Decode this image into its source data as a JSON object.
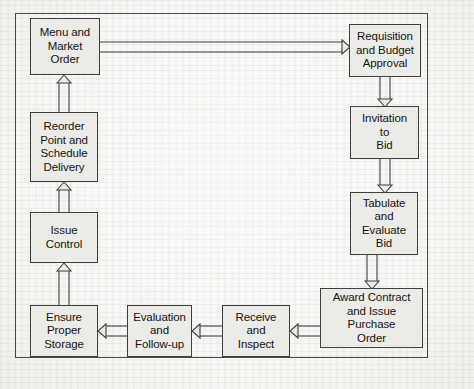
{
  "diagram": {
    "type": "flowchart",
    "orientation": "clockwise-loop",
    "frame": {
      "border_color": "#4a4a48"
    },
    "node_style": {
      "fill": "#ebebe8",
      "border": "#3f3f3d",
      "text": "#14140f"
    },
    "nodes": [
      {
        "id": "menu-and-market-order",
        "label": "Menu and\nMarket\nOrder",
        "x": 30,
        "y": 18,
        "w": 70,
        "h": 57
      },
      {
        "id": "requisition-and-budget-approval",
        "label": "Requisition\nand Budget\nApproval",
        "x": 349,
        "y": 24,
        "w": 72,
        "h": 53
      },
      {
        "id": "invitation-to-bid",
        "label": "Invitation\nto\nBid",
        "x": 350,
        "y": 106,
        "w": 69,
        "h": 53
      },
      {
        "id": "tabulate-and-evaluate-bid",
        "label": "Tabulate\nand\nEvaluate\nBid",
        "x": 350,
        "y": 192,
        "w": 68,
        "h": 63
      },
      {
        "id": "award-contract-and-issue-purchase-order",
        "label": "Award Contract\nand Issue\nPurchase\nOrder",
        "x": 320,
        "y": 288,
        "w": 103,
        "h": 60
      },
      {
        "id": "receive-and-inspect",
        "label": "Receive\nand\nInspect",
        "x": 222,
        "y": 305,
        "w": 68,
        "h": 52
      },
      {
        "id": "evaluation-and-follow-up",
        "label": "Evaluation\nand\nFollow-up",
        "x": 127,
        "y": 305,
        "w": 65,
        "h": 52
      },
      {
        "id": "ensure-proper-storage",
        "label": "Ensure\nProper\nStorage",
        "x": 30,
        "y": 305,
        "w": 68,
        "h": 52
      },
      {
        "id": "issue-control",
        "label": "Issue\nControl",
        "x": 30,
        "y": 212,
        "w": 68,
        "h": 51
      },
      {
        "id": "reorder-point-and-schedule-delivery",
        "label": "Reorder\nPoint and\nSchedule\nDelivery",
        "x": 30,
        "y": 112,
        "w": 68,
        "h": 70
      }
    ],
    "edges": [
      {
        "id": "menu-to-requisition",
        "from": "menu-and-market-order",
        "to": "requisition-and-budget-approval",
        "direction": "right"
      },
      {
        "id": "requisition-to-invitation",
        "from": "requisition-and-budget-approval",
        "to": "invitation-to-bid",
        "direction": "down"
      },
      {
        "id": "invitation-to-tabulate",
        "from": "invitation-to-bid",
        "to": "tabulate-and-evaluate-bid",
        "direction": "down"
      },
      {
        "id": "tabulate-to-award",
        "from": "tabulate-and-evaluate-bid",
        "to": "award-contract-and-issue-purchase-order",
        "direction": "down"
      },
      {
        "id": "award-to-receive",
        "from": "award-contract-and-issue-purchase-order",
        "to": "receive-and-inspect",
        "direction": "left"
      },
      {
        "id": "receive-to-evaluation",
        "from": "receive-and-inspect",
        "to": "evaluation-and-follow-up",
        "direction": "left"
      },
      {
        "id": "evaluation-to-storage",
        "from": "evaluation-and-follow-up",
        "to": "ensure-proper-storage",
        "direction": "left"
      },
      {
        "id": "storage-to-issue-control",
        "from": "ensure-proper-storage",
        "to": "issue-control",
        "direction": "up"
      },
      {
        "id": "issue-control-to-reorder",
        "from": "issue-control",
        "to": "reorder-point-and-schedule-delivery",
        "direction": "up"
      },
      {
        "id": "reorder-to-menu",
        "from": "reorder-point-and-schedule-delivery",
        "to": "menu-and-market-order",
        "direction": "up"
      }
    ]
  }
}
